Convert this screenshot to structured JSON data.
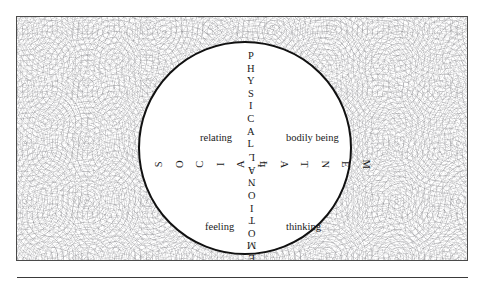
{
  "figure": {
    "axes": {
      "vertical_top": {
        "name": "physical-axis",
        "text": "PHYSICAL",
        "letters": [
          "P",
          "H",
          "Y",
          "S",
          "I",
          "C",
          "A",
          "L"
        ]
      },
      "vertical_bottom": {
        "name": "emotional-axis",
        "text": "EMOTIONAL",
        "letters": [
          "E",
          "M",
          "O",
          "T",
          "I",
          "O",
          "N",
          "A",
          "L"
        ]
      },
      "horizontal_left": {
        "name": "social-axis",
        "text": "SOCIAL",
        "letters": [
          "S",
          "O",
          "C",
          "I",
          "A",
          "L"
        ]
      },
      "horizontal_right": {
        "name": "mental-axis",
        "text": "MENTAL",
        "letters": [
          "M",
          "E",
          "N",
          "T",
          "A",
          "L"
        ]
      }
    },
    "quadrant_labels": {
      "top_left": "relating",
      "top_right": "bodily being",
      "bottom_left": "feeling",
      "bottom_right": "thinking"
    },
    "colors": {
      "circle_stroke": "#111111",
      "box_border": "#4a4a4a",
      "text": "#1a1a1a",
      "texture": "#78787d",
      "background": "#ffffff",
      "rule": "#3a3a3a"
    }
  }
}
